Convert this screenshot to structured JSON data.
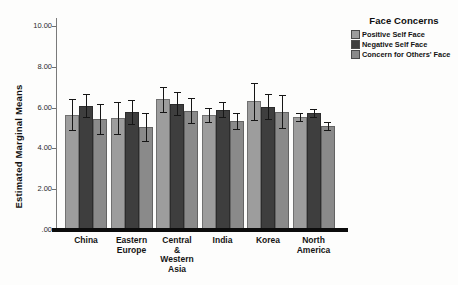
{
  "figure": {
    "background": "#fdfdfc"
  },
  "chart_data": {
    "type": "bar",
    "title": "",
    "xlabel": "",
    "ylabel": "Estimated Marginal Means",
    "ylim": [
      0,
      10.4
    ],
    "grid": false,
    "yticks": [
      {
        "value": 0,
        "label": ".00"
      },
      {
        "value": 2,
        "label": "2.00"
      },
      {
        "value": 4,
        "label": "4.00"
      },
      {
        "value": 6,
        "label": "6.00"
      },
      {
        "value": 8,
        "label": "8.00"
      },
      {
        "value": 10,
        "label": "10.00"
      }
    ],
    "legend": {
      "title": "Face Concerns",
      "position": "top-right"
    },
    "categories": [
      {
        "name": "China",
        "lines": [
          "China"
        ]
      },
      {
        "name": "Eastern Europe",
        "lines": [
          "Eastern",
          "Europe"
        ]
      },
      {
        "name": "Central & Western Asia",
        "lines": [
          "Central",
          "&",
          "Western",
          "Asia"
        ]
      },
      {
        "name": "India",
        "lines": [
          "India"
        ]
      },
      {
        "name": "Korea",
        "lines": [
          "Korea"
        ]
      },
      {
        "name": "North America",
        "lines": [
          "North",
          "America"
        ]
      }
    ],
    "series": [
      {
        "name": "Positive Self Face",
        "color": "#9d9d9d",
        "values": [
          5.65,
          5.5,
          6.4,
          5.65,
          6.3,
          5.55
        ],
        "errors": [
          0.75,
          0.78,
          0.6,
          0.35,
          0.9,
          0.2
        ]
      },
      {
        "name": "Negative Self Face",
        "color": "#3e3e3e",
        "values": [
          6.1,
          5.8,
          6.2,
          5.9,
          6.05,
          5.75
        ],
        "errors": [
          0.55,
          0.58,
          0.58,
          0.38,
          0.6,
          0.2
        ]
      },
      {
        "name": "Concern for Others' Face",
        "color": "#8a8a8a",
        "values": [
          5.45,
          5.05,
          5.85,
          5.35,
          5.8,
          5.1
        ],
        "errors": [
          0.72,
          0.67,
          0.6,
          0.38,
          0.82,
          0.18
        ]
      }
    ],
    "error_bar_color": "#161616",
    "axis_color": "#7a7a7a",
    "baseline_color": "#0c0c0c"
  }
}
